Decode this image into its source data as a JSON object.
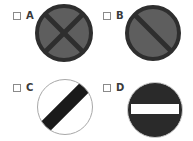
{
  "question": {
    "options": [
      {
        "id": "A",
        "label": "A",
        "sign": "no-stopping",
        "description": "Grey circular sign with dark border and dark X cross",
        "colors": {
          "fill": "#5e5e5e",
          "border": "#2e2e2e",
          "mark": "#2e2e2e"
        }
      },
      {
        "id": "B",
        "label": "B",
        "sign": "no-waiting",
        "description": "Grey circular sign with dark border and single diagonal bar",
        "colors": {
          "fill": "#5e5e5e",
          "border": "#2e2e2e",
          "mark": "#2e2e2e"
        }
      },
      {
        "id": "C",
        "label": "C",
        "sign": "national-speed-limit",
        "description": "White circular sign with thin grey outline and black diagonal band",
        "colors": {
          "fill": "#ffffff",
          "border": "#a8a8a8",
          "mark": "#1a1a1a"
        }
      },
      {
        "id": "D",
        "label": "D",
        "sign": "no-entry",
        "description": "Dark circular sign with white horizontal bar",
        "colors": {
          "fill": "#2a2a2a",
          "border": "#cfcfcf",
          "mark": "#ffffff"
        }
      }
    ]
  }
}
